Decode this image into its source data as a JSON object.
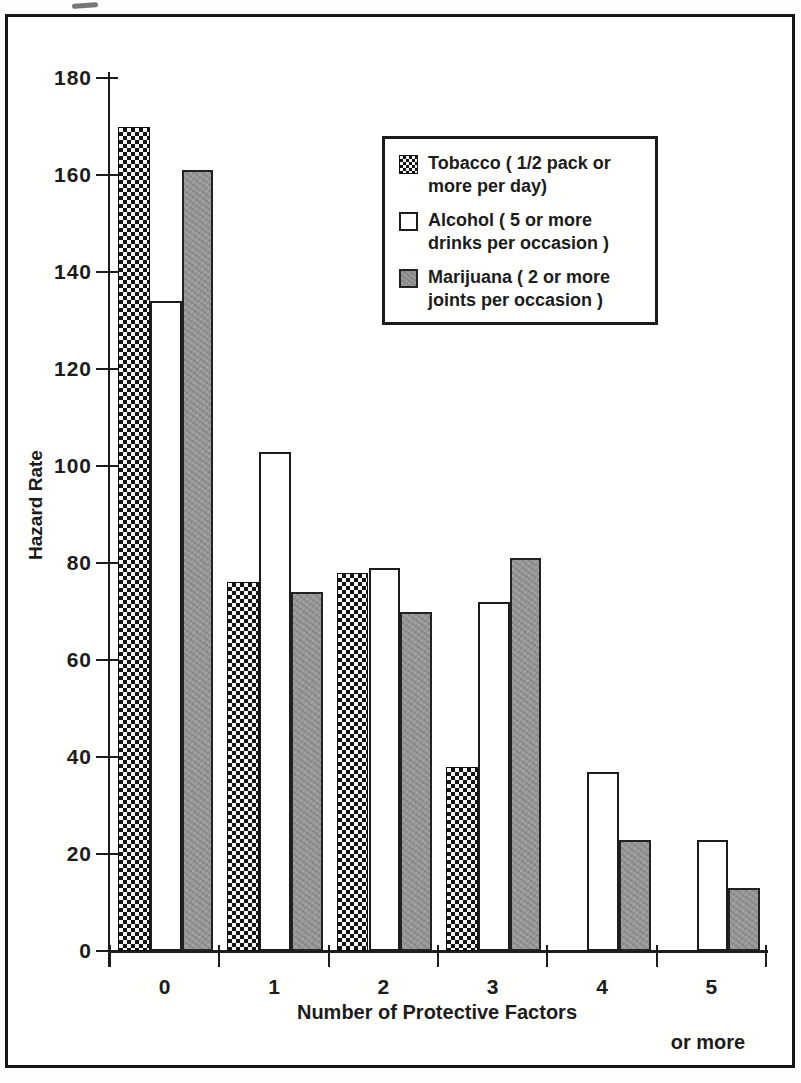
{
  "colors": {
    "ink": "#1c1c1c",
    "paper": "#fffffe",
    "marijuana_gray": "#989896",
    "tobacco_pattern": "black-white-checker",
    "alcohol_fill": "white"
  },
  "axes": {
    "y_title": "Hazard Rate",
    "x_title": "Number of Protective Factors",
    "x_subtitle": "or more",
    "y_tick_labels": [
      "0",
      "20",
      "40",
      "60",
      "80",
      "100",
      "120",
      "140",
      "160",
      "180"
    ],
    "x_tick_labels": [
      "0",
      "1",
      "2",
      "3",
      "4",
      "5"
    ]
  },
  "legend": {
    "items": [
      {
        "swatch": "tobacco-checker-swatch",
        "label": "Tobacco ( 1/2 pack or more per day)"
      },
      {
        "swatch": "alcohol-white-swatch",
        "label": "Alcohol ( 5 or more drinks per occasion )"
      },
      {
        "swatch": "marijuana-gray-swatch",
        "label": "Marijuana ( 2 or more joints per occasion )"
      }
    ]
  },
  "chart_data": {
    "type": "bar",
    "title": "",
    "xlabel": "Number of Protective Factors",
    "ylabel": "Hazard Rate",
    "ylim": [
      0,
      180
    ],
    "y_tick_step": 20,
    "grid": false,
    "legend_position": "upper right inside plot",
    "categories": [
      "0",
      "1",
      "2",
      "3",
      "4",
      "5 or more"
    ],
    "series": [
      {
        "name": "Tobacco ( 1/2 pack or more per day)",
        "style": "tobacco",
        "values": [
          170,
          76,
          78,
          38,
          null,
          null
        ]
      },
      {
        "name": "Alcohol ( 5 or more drinks per occasion )",
        "style": "alcohol",
        "values": [
          134,
          103,
          79,
          72,
          37,
          23
        ]
      },
      {
        "name": "Marijuana ( 2 or more joints per occasion )",
        "style": "marijuana",
        "values": [
          161,
          74,
          70,
          81,
          23,
          13
        ]
      }
    ]
  }
}
